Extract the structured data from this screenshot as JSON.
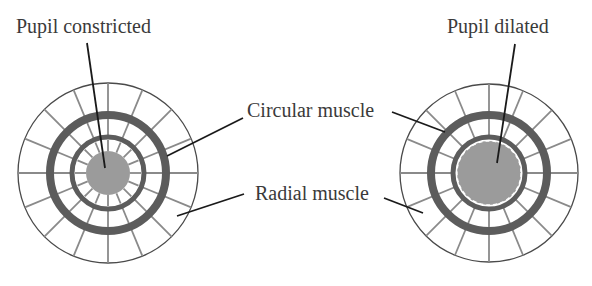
{
  "labels": {
    "pupil_constricted": "Pupil constricted",
    "pupil_dilated": "Pupil dilated",
    "circular_muscle": "Circular muscle",
    "radial_muscle": "Radial muscle"
  },
  "colors": {
    "pupil": "#9b9b9b",
    "muscle_ring": "#5c5c5c",
    "radial_spokes": "#8a8a8a",
    "outline": "#4a4a4a",
    "leader": "#1a1a1a",
    "text": "#3a3a3a"
  },
  "eyes": [
    {
      "name": "constricted",
      "cx": 108,
      "cy": 173,
      "outer_r": 90,
      "thick_ring_r": 58,
      "inner_ring_r": 36,
      "pupil_r": 22,
      "spokes": 16
    },
    {
      "name": "dilated",
      "cx": 489,
      "cy": 173,
      "outer_r": 89,
      "thick_ring_r": 58,
      "inner_ring_r": 36,
      "pupil_r": 31,
      "spokes": 16
    }
  ]
}
